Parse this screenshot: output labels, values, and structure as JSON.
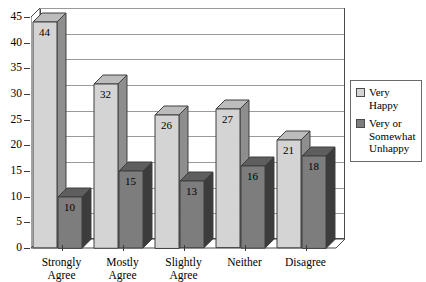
{
  "chart_data": {
    "type": "bar",
    "title": "",
    "subtitle": "",
    "xlabel": "",
    "ylabel": "",
    "ylim": [
      0,
      45
    ],
    "ytick_step": 5,
    "yticks": [
      "0",
      "5",
      "10",
      "15",
      "20",
      "25",
      "30",
      "35",
      "40",
      "45"
    ],
    "grid": true,
    "grid_axis": "y",
    "legend_position": "right",
    "style": "3d-column",
    "categories": [
      "Strongly Agree",
      "Mostly Agree",
      "Slightly Agree",
      "Neither",
      "Disagree"
    ],
    "series": [
      {
        "name": "Very Happy",
        "color": "#d4d4d4",
        "side_color": "#8e8e8e",
        "top_color": "#bcbcbc",
        "values": [
          44,
          32,
          26,
          27,
          21
        ]
      },
      {
        "name": "Very or Somewhat Unhappy",
        "color": "#7d7d7d",
        "side_color": "#3c3c3c",
        "top_color": "#5e5e5e",
        "values": [
          10,
          15,
          13,
          16,
          18
        ]
      }
    ]
  },
  "legend": {
    "items": [
      {
        "label": "Very Happy",
        "swatch": "#d4d4d4"
      },
      {
        "label": "Very or Somewhat Unhappy",
        "swatch": "#7d7d7d"
      }
    ]
  },
  "axes": {
    "y_tick_labels": [
      "45",
      "40",
      "35",
      "30",
      "25",
      "20",
      "15",
      "10",
      "5",
      "0"
    ],
    "x_tick_labels": [
      "Strongly Agree",
      "Mostly Agree",
      "Slightly Agree",
      "Neither",
      "Disagree"
    ]
  },
  "colors": {
    "plot_border": "#4a4a4a",
    "gridline": "#9a9a9a",
    "background": "#ffffff",
    "text": "#000000"
  }
}
